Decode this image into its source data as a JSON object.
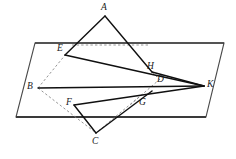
{
  "figure": {
    "type": "geometry-diagram",
    "width": 236,
    "height": 159,
    "background_color": "#ffffff",
    "stroke_color": "#1a1a1a",
    "dashed_color": "#7a7a7a",
    "plane_edge_color": "#555555"
  },
  "points": {
    "A": {
      "label": "A",
      "x": 105,
      "y": 16,
      "label_x": 101,
      "label_y": 3
    },
    "B": {
      "label": "B",
      "x": 38,
      "y": 88,
      "label_x": 27,
      "label_y": 82
    },
    "C": {
      "label": "C",
      "x": 96,
      "y": 133,
      "label_x": 92,
      "label_y": 137
    },
    "D": {
      "label": "D",
      "x": 158,
      "y": 82,
      "label_x": 157,
      "label_y": 75
    },
    "E": {
      "label": "E",
      "x": 65,
      "y": 55,
      "label_x": 57,
      "label_y": 44
    },
    "F": {
      "label": "F",
      "x": 74,
      "y": 105,
      "label_x": 66,
      "label_y": 98
    },
    "G": {
      "label": "G",
      "x": 139,
      "y": 97,
      "label_x": 139,
      "label_y": 98
    },
    "H": {
      "label": "H",
      "x": 152,
      "y": 72,
      "label_x": 147,
      "label_y": 62
    },
    "K": {
      "label": "K",
      "x": 204,
      "y": 86,
      "label_x": 207,
      "label_y": 80
    }
  },
  "plane": {
    "name": "plane-parallelogram",
    "corners": [
      {
        "x": 35,
        "y": 43
      },
      {
        "x": 224,
        "y": 43
      },
      {
        "x": 206,
        "y": 117
      },
      {
        "x": 16,
        "y": 117
      }
    ]
  },
  "solid_segments": [
    {
      "name": "segment-A-E",
      "from": "A",
      "to": "E"
    },
    {
      "name": "segment-A-H",
      "from": "A",
      "to": "H"
    },
    {
      "name": "segment-E-K",
      "from": "E",
      "to": "K"
    },
    {
      "name": "segment-B-K",
      "from": "B",
      "to": "K"
    },
    {
      "name": "segment-F-K",
      "from": "F",
      "to": "K"
    },
    {
      "name": "segment-H-K",
      "from": "H",
      "to": "K"
    },
    {
      "name": "segment-F-C",
      "from": "F",
      "to": "C"
    },
    {
      "name": "segment-C-G",
      "from": "C",
      "to": "G"
    }
  ],
  "dashed_segments": [
    {
      "name": "segment-B-E-dashed",
      "from": "B",
      "to": "E"
    },
    {
      "name": "segment-B-F-dashed",
      "from": "B",
      "to": "F"
    },
    {
      "name": "segment-E-H-dashed",
      "from": "E",
      "to": "H"
    },
    {
      "name": "segment-D-G-dashed",
      "from": "D",
      "to": "G"
    },
    {
      "name": "segment-H-D-dashed",
      "from": "H",
      "to": "D"
    },
    {
      "name": "segment-G-F-extend-dashed",
      "from": "G",
      "to": "F"
    }
  ]
}
